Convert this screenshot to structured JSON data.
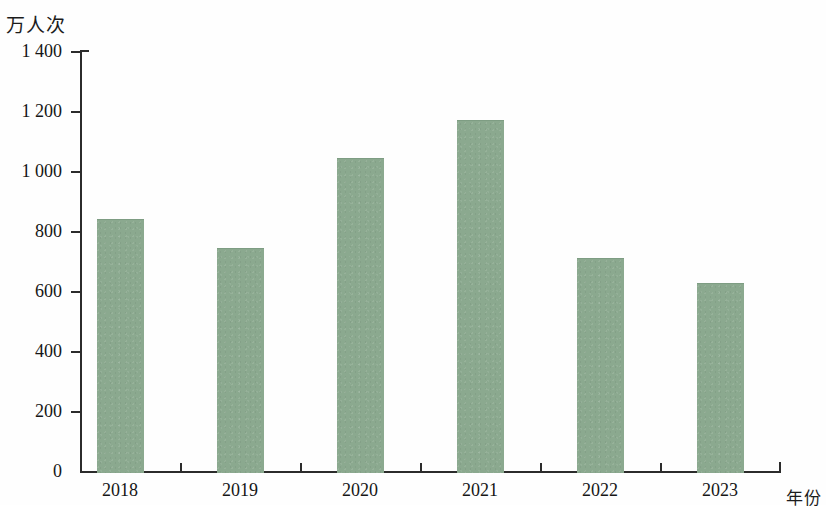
{
  "chart_data": {
    "type": "bar",
    "title": "",
    "subtitle": "",
    "xlabel": "年份",
    "ylabel": "万人次",
    "categories": [
      "2018",
      "2019",
      "2020",
      "2021",
      "2022",
      "2023"
    ],
    "values": [
      840,
      745,
      1045,
      1170,
      710,
      630
    ],
    "series": [
      {
        "name": "万人次",
        "values": [
          840,
          745,
          1045,
          1170,
          710,
          630
        ]
      }
    ],
    "ylim": [
      0,
      1400
    ],
    "yticks": [
      0,
      200,
      400,
      600,
      800,
      1000,
      1200,
      1400
    ],
    "ytick_labels": [
      "0",
      "200",
      "400",
      "600",
      "800",
      "1 000",
      "1 200",
      "1 400"
    ],
    "grid": false,
    "legend": false,
    "legend_position": "none",
    "bar_color": "#8ba98f",
    "axis_color": "#2b2b2b"
  }
}
